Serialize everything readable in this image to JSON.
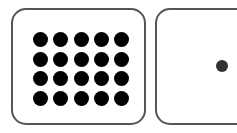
{
  "cards": [
    {
      "id": "left",
      "dot_count": 20,
      "rows": 4,
      "columns": 5,
      "dot_color": "#000000"
    },
    {
      "id": "right",
      "dot_count": 1,
      "dot_color": "#333333"
    }
  ],
  "colors": {
    "border": "#555555",
    "background": "#ffffff"
  }
}
